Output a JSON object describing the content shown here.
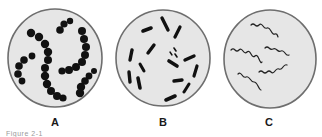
{
  "figure": {
    "panels": [
      {
        "id": "A",
        "label": "A",
        "subject": "cocci-in-chains",
        "dish_fill": "#e6e6e6",
        "stroke": "#6e6e6e",
        "organism_color": "#111111"
      },
      {
        "id": "B",
        "label": "B",
        "subject": "bacilli-rods",
        "dish_fill": "#e6e6e6",
        "stroke": "#6e6e6e",
        "organism_color": "#111111"
      },
      {
        "id": "C",
        "label": "C",
        "subject": "spirilla",
        "dish_fill": "#e6e6e6",
        "stroke": "#6e6e6e",
        "organism_color": "#222222"
      }
    ],
    "caption": "Figure 2-1"
  }
}
